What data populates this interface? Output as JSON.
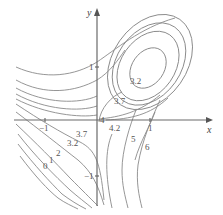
{
  "diagram": {
    "type": "contour-plot",
    "axes": {
      "x_label": "x",
      "y_label": "y",
      "x_ticks": [
        "−1",
        "1"
      ],
      "y_ticks": [
        "1",
        "−1"
      ]
    },
    "level_labels": {
      "inner_ellipse": "3.2",
      "upper_ellipse": "3.7",
      "saddle": "4",
      "right_4_2": "4.2",
      "right_5": "5",
      "right_6": "6",
      "left_3_7": "3.7",
      "left_3_2": "3.2",
      "left_2": "2",
      "left_1": "1",
      "left_0": "0"
    },
    "colors": {
      "curve": "#8a8a8a",
      "axis": "#6a6a6a",
      "text": "#555555"
    }
  }
}
